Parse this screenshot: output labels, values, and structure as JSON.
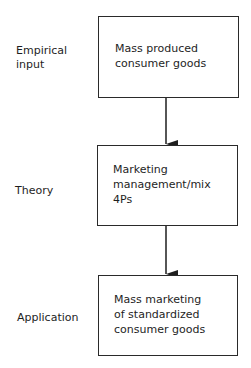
{
  "diagram": {
    "rows": [
      {
        "label": "Empirical\ninput",
        "box_text": "Mass produced\nconsumer goods"
      },
      {
        "label": "Theory",
        "box_text": "Marketing\nmanagement/mix\n4Ps"
      },
      {
        "label": "Application",
        "box_text": "Mass marketing\nof standardized\nconsumer goods"
      }
    ],
    "edges": [
      {
        "from": "Mass produced consumer goods",
        "to": "Marketing management/mix 4Ps"
      },
      {
        "from": "Marketing management/mix 4Ps",
        "to": "Mass marketing of standardized consumer goods"
      }
    ]
  }
}
